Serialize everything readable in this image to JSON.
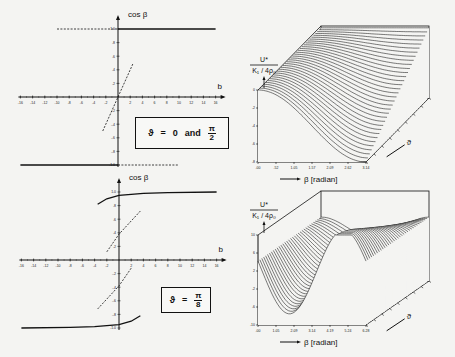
{
  "chart_data": [
    {
      "panel": "top-left",
      "type": "line",
      "title": "",
      "xlabel": "b",
      "ylabel": "cos β",
      "xlim": [
        -16,
        16
      ],
      "ylim": [
        -1.0,
        1.0
      ],
      "x_ticks": [
        "-16",
        "-14",
        "-12",
        "-10",
        "-8",
        "-6",
        "-4",
        "-2",
        "2",
        "4",
        "6",
        "8",
        "10",
        "12",
        "14",
        "16"
      ],
      "y_ticks": [
        "1.0",
        ".8",
        ".6",
        ".4",
        ".2",
        "-.2",
        "-.4",
        "-.6",
        "-.8",
        "-1.0"
      ],
      "legend": {
        "symbol": "ϑ",
        "text": "ϑ = 0 and π/2",
        "eq": "=",
        "value": "0",
        "conj": "and",
        "frac_num": "π",
        "frac_den": "2"
      },
      "series": [
        {
          "name": "stable upper",
          "style": "solid",
          "x": [
            0,
            16
          ],
          "y": [
            1.0,
            1.0
          ]
        },
        {
          "name": "metastable upper",
          "style": "dashed",
          "x": [
            -10,
            0
          ],
          "y": [
            1.0,
            1.0
          ]
        },
        {
          "name": "stable lower",
          "style": "solid",
          "x": [
            -16,
            0
          ],
          "y": [
            -1.0,
            -1.0
          ]
        },
        {
          "name": "metastable lower",
          "style": "dashed",
          "x": [
            0,
            10
          ],
          "y": [
            -1.0,
            -1.0
          ]
        },
        {
          "name": "unstable",
          "style": "dashed",
          "x": [
            -2.5,
            2.5
          ],
          "y": [
            -0.5,
            0.5
          ]
        }
      ],
      "grid": false
    },
    {
      "panel": "bottom-left",
      "type": "line",
      "xlabel": "b",
      "ylabel": "cos β",
      "xlim": [
        -16,
        16
      ],
      "ylim": [
        -1.0,
        1.0
      ],
      "x_ticks": [
        "-16",
        "-14",
        "-12",
        "-10",
        "-8",
        "-6",
        "-4",
        "-2",
        "2",
        "4",
        "6",
        "8",
        "10",
        "12",
        "14",
        "16"
      ],
      "y_ticks": [
        "1.0",
        ".8",
        ".6",
        ".4",
        ".2",
        "-.2",
        "-.4",
        "-.6",
        "-.8",
        "-1.0"
      ],
      "legend": {
        "symbol": "ϑ",
        "text": "ϑ = π/8",
        "eq": "=",
        "frac_num": "π",
        "frac_den": "8"
      },
      "series": [
        {
          "name": "stable upper",
          "style": "solid",
          "x": [
            -3.5,
            -2,
            0,
            4,
            8,
            16
          ],
          "y": [
            0.82,
            0.9,
            0.95,
            0.98,
            0.99,
            1.0
          ]
        },
        {
          "name": "stable lower",
          "style": "solid",
          "x": [
            -16,
            -8,
            -4,
            0,
            2,
            3.5
          ],
          "y": [
            -1.0,
            -0.99,
            -0.98,
            -0.95,
            -0.9,
            -0.82
          ]
        },
        {
          "name": "unstable upper",
          "style": "dashed",
          "x": [
            -2,
            0,
            3.5
          ],
          "y": [
            0.12,
            0.38,
            0.72
          ]
        },
        {
          "name": "unstable lower",
          "style": "dashed",
          "x": [
            -3.5,
            0,
            2
          ],
          "y": [
            -0.72,
            -0.38,
            -0.12
          ]
        }
      ],
      "grid": false
    },
    {
      "panel": "top-right",
      "type": "surface",
      "zlabel_num": "U*",
      "zlabel_den": "K₁ / 4ρ₀",
      "xlabel": "β [radian]",
      "ylabel": "ϑ",
      "x_ticks": [
        ".00",
        ".52",
        "1.05",
        "1.57",
        "2.09",
        "2.62",
        "3.14"
      ],
      "z_ticks": [
        "0",
        "-2",
        "-4",
        "-6",
        "-8"
      ],
      "xlim": [
        0,
        3.14
      ],
      "zlim": [
        -8,
        0
      ]
    },
    {
      "panel": "bottom-right",
      "type": "surface",
      "zlabel_num": "U*",
      "zlabel_den": "K₁ / 4ρ₀",
      "xlabel": "β [radian]",
      "ylabel": "ϑ",
      "x_ticks": [
        ".00",
        "1.05",
        "2.09",
        "3.14",
        "4.19",
        "5.24",
        "6.28"
      ],
      "z_ticks": [
        "10",
        "6",
        "2",
        "-2",
        "-6",
        "-10"
      ],
      "xlim": [
        0,
        6.28
      ],
      "zlim": [
        -10,
        10
      ]
    }
  ],
  "labels": {
    "cos_beta": "cos β",
    "b": "b",
    "u_star": "U*",
    "k_denom": "K₁ / 4ρ₀",
    "beta_radian": "β [radian]",
    "theta": "ϑ"
  }
}
